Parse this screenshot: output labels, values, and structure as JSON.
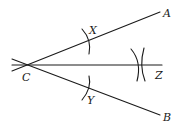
{
  "diagram": {
    "type": "geometric-construction",
    "colors": {
      "stroke": "#1a1a1a",
      "background": "#ffffff"
    },
    "points": {
      "C": {
        "label": "C",
        "x": 28,
        "y": 65
      },
      "A": {
        "label": "A",
        "x": 160,
        "y": 12
      },
      "B": {
        "label": "B",
        "x": 160,
        "y": 115
      },
      "X": {
        "label": "X",
        "x": 87,
        "y": 41
      },
      "Y": {
        "label": "Y",
        "x": 87,
        "y": 89
      },
      "Z": {
        "label": "Z",
        "x": 141,
        "y": 65
      }
    },
    "segments": [
      {
        "from": "C",
        "to": "A",
        "name": "ray-CA"
      },
      {
        "from": "C",
        "to": "B",
        "name": "ray-CB"
      },
      {
        "from": "C",
        "to": "Z",
        "name": "bisector-CZ"
      }
    ],
    "labels": {
      "A": "A",
      "B": "B",
      "C": "C",
      "X": "X",
      "Y": "Y",
      "Z": "Z"
    }
  }
}
